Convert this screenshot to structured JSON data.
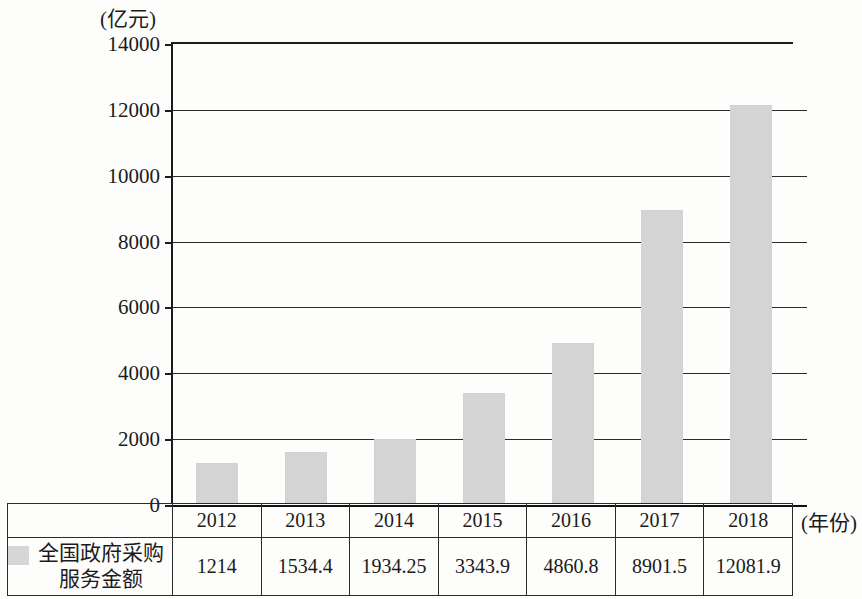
{
  "axes": {
    "y_unit_label": "(亿元)",
    "x_unit_label": "(年份)",
    "y_ticks": [
      "14000",
      "12000",
      "10000",
      "8000",
      "6000",
      "4000",
      "2000",
      "0"
    ]
  },
  "legend": {
    "swatch_color": "#d4d4d4",
    "series_label": "全国政府采购\n服务金额"
  },
  "table": {
    "years": [
      "2012",
      "2013",
      "2014",
      "2015",
      "2016",
      "2017",
      "2018"
    ],
    "values": [
      "1214",
      "1534.4",
      "1934.25",
      "3343.9",
      "4860.8",
      "8901.5",
      "12081.9"
    ]
  },
  "chart_data": {
    "type": "bar",
    "title": "",
    "xlabel": "(年份)",
    "ylabel": "(亿元)",
    "categories": [
      "2012",
      "2013",
      "2014",
      "2015",
      "2016",
      "2017",
      "2018"
    ],
    "values": [
      1214,
      1534.4,
      1934.25,
      3343.9,
      4860.8,
      8901.5,
      12081.9
    ],
    "series": [
      {
        "name": "全国政府采购服务金额",
        "values": [
          1214,
          1534.4,
          1934.25,
          3343.9,
          4860.8,
          8901.5,
          12081.9
        ]
      }
    ],
    "ylim": [
      0,
      14000
    ],
    "ytick_values": [
      0,
      2000,
      4000,
      6000,
      8000,
      10000,
      12000,
      14000
    ],
    "grid": true,
    "legend_position": "bottom-left-table",
    "bar_color": "#d4d4d4"
  }
}
